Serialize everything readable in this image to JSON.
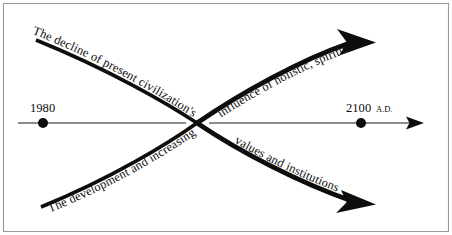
{
  "figure": {
    "background_color": "#ffffff",
    "ink_color": "#0d0d0d",
    "frame_color": "#9a9a9a"
  },
  "timeline": {
    "start_label": "1980",
    "end_label": "2100",
    "end_suffix": "A.D.",
    "axis_name": "time-axis"
  },
  "curves": {
    "declining": {
      "label_head": "The decline of present civilization's",
      "label_tail": "values and institutions",
      "direction": "down-right",
      "arrow": "solid-triangle"
    },
    "rising": {
      "label_head": "The development and increasing",
      "label_tail": "influence of holistic, spiritual values and institutions",
      "direction": "up-right",
      "arrow": "solid-triangle"
    }
  },
  "text_runs": {
    "top_left": "The decline of present civilization's",
    "top_right": "influence of holistic, spiritual values and institutions",
    "bottom_left": "The development and increasing",
    "bottom_right": "values and institutions"
  }
}
